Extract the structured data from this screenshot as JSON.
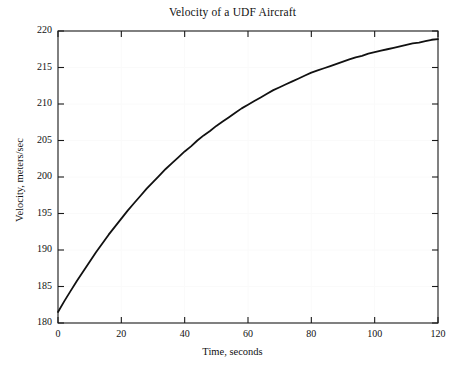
{
  "chart_data": {
    "type": "line",
    "title": "Velocity of a UDF Aircraft",
    "xlabel": "Time, seconds",
    "ylabel": "Velocity, meters/sec",
    "xlim": [
      0,
      120
    ],
    "ylim": [
      180,
      220
    ],
    "xticks": [
      0,
      20,
      40,
      60,
      80,
      100,
      120
    ],
    "yticks": [
      180,
      185,
      190,
      195,
      200,
      205,
      210,
      215,
      220
    ],
    "xtick_labels": [
      "0",
      "20",
      "40",
      "60",
      "80",
      "100",
      "120"
    ],
    "ytick_labels": [
      "180",
      "185",
      "190",
      "195",
      "200",
      "205",
      "210",
      "215",
      "220"
    ],
    "grid": true,
    "legend": null,
    "line_color": "#111111",
    "line_width": 1.8,
    "series": [
      {
        "name": "Velocity",
        "x": [
          0,
          2,
          4,
          6,
          8,
          10,
          12,
          14,
          16,
          18,
          20,
          22,
          24,
          26,
          28,
          30,
          32,
          34,
          36,
          38,
          40,
          42,
          44,
          46,
          48,
          50,
          52,
          54,
          56,
          58,
          60,
          62,
          64,
          66,
          68,
          70,
          72,
          74,
          76,
          78,
          80,
          82,
          84,
          86,
          88,
          90,
          92,
          94,
          96,
          98,
          100,
          102,
          104,
          106,
          108,
          110,
          112,
          114,
          116,
          118,
          120
        ],
        "y": [
          181.5,
          183.0,
          184.4,
          185.8,
          187.1,
          188.4,
          189.7,
          190.9,
          192.1,
          193.2,
          194.3,
          195.4,
          196.4,
          197.4,
          198.4,
          199.3,
          200.2,
          201.1,
          201.9,
          202.7,
          203.5,
          204.2,
          205.0,
          205.7,
          206.3,
          207.0,
          207.6,
          208.2,
          208.8,
          209.4,
          209.9,
          210.4,
          210.9,
          211.4,
          211.9,
          212.3,
          212.7,
          213.1,
          213.5,
          213.9,
          214.3,
          214.6,
          214.9,
          215.2,
          215.5,
          215.8,
          216.1,
          216.4,
          216.6,
          216.9,
          217.1,
          217.3,
          217.5,
          217.7,
          217.9,
          218.1,
          218.3,
          218.4,
          218.6,
          218.8,
          218.9
        ]
      }
    ],
    "annotations": []
  },
  "figure": {
    "background": "#ffffff",
    "axes_color": "#1a1a1a",
    "grid_color": "#fafafa"
  }
}
